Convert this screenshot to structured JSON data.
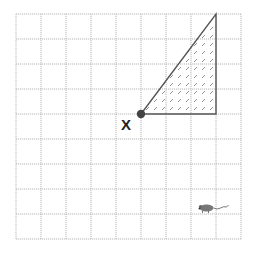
{
  "diagram": {
    "type": "grid-with-shape",
    "grid": {
      "columns": 9,
      "rows": 9,
      "origin_px": [
        16,
        14
      ],
      "cell_px": 25,
      "line_color": "#b8b8b8",
      "line_style": "dotted"
    },
    "shape": {
      "kind": "right-triangle",
      "fill": "hatched",
      "stroke_color": "#555555",
      "hatch_color": "#888888",
      "vertices_grid": [
        [
          5,
          4
        ],
        [
          8,
          0
        ],
        [
          8,
          4
        ]
      ]
    },
    "point": {
      "label": "X",
      "grid": [
        5,
        4
      ],
      "color": "#444444"
    },
    "mouse": {
      "icon": "mouse-icon",
      "grid_approx": [
        7.3,
        7.8
      ]
    }
  }
}
